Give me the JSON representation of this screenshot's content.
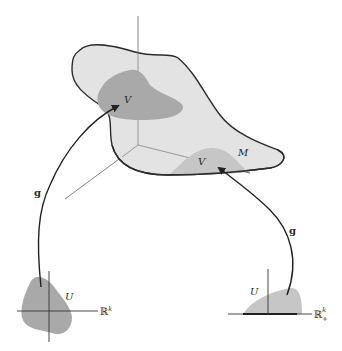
{
  "figure": {
    "manifold_label": "M",
    "interior_patch": {
      "image_label": "V",
      "map_label": "g",
      "domain_label": "U",
      "space_label": "ℝ",
      "space_superscript": "k",
      "space_subscript": ""
    },
    "boundary_patch": {
      "image_label": "V",
      "map_label": "g",
      "domain_label": "U",
      "space_label": "ℝ",
      "space_superscript": "k",
      "space_subscript": "+"
    },
    "colors": {
      "manifold_fill": "#e3e3e3",
      "patch_fill": "#a9a9a9",
      "boundary_patch_fill": "#c6c6c6",
      "outline": "#2b2b2b",
      "axis": "#555555"
    }
  }
}
